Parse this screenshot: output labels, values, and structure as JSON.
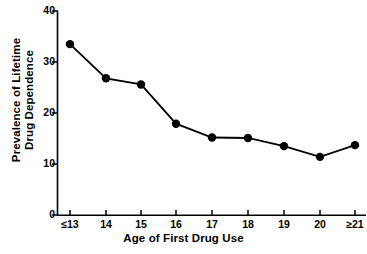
{
  "chart_data": {
    "type": "line",
    "title": "",
    "subtitle": "",
    "xlabel": "Age of First Drug Use",
    "ylabel": "Prevalence of Lifetime Drug Dependence",
    "ylabel_lines": [
      "Prevalence of Lifetime",
      "Drug Dependence"
    ],
    "categories": [
      "≤13",
      "14",
      "15",
      "16",
      "17",
      "18",
      "19",
      "20",
      "≥21"
    ],
    "values": [
      33.5,
      26.8,
      25.6,
      17.9,
      15.2,
      15.1,
      13.5,
      11.4,
      13.7
    ],
    "series": [
      {
        "name": "Prevalence of Lifetime Drug Dependence",
        "values": [
          33.5,
          26.8,
          25.6,
          17.9,
          15.2,
          15.1,
          13.5,
          11.4,
          13.7
        ]
      }
    ],
    "ylim": [
      0,
      40
    ],
    "yticks": [
      0,
      10,
      20,
      30,
      40
    ],
    "ytick_labels": [
      "0",
      "10",
      "20",
      "30",
      "40"
    ],
    "xtick_labels": [
      "≤13",
      "14",
      "15",
      "16",
      "17",
      "18",
      "19",
      "20",
      "≥21"
    ],
    "grid": false,
    "legend": false,
    "legend_position": "none",
    "marker": "filled-circle",
    "line_color": "#000000",
    "marker_color": "#000000",
    "axis_color": "#000000",
    "background_color": "#ffffff"
  }
}
